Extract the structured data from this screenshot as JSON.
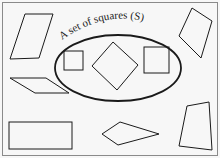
{
  "diagram": {
    "type": "set-diagram",
    "set_label": "A set of squares (S)",
    "colors": {
      "background": "#f7f7f7",
      "stroke": "#1a1a1a",
      "frame": "#8a8a8a"
    },
    "inside_set": [
      {
        "shape": "square",
        "name": "small-square"
      },
      {
        "shape": "square-rotated",
        "name": "diamond-square"
      },
      {
        "shape": "square",
        "name": "right-square"
      }
    ],
    "outside_set": [
      {
        "shape": "parallelogram",
        "name": "top-left-parallelogram"
      },
      {
        "shape": "quadrilateral",
        "name": "top-right-quadrilateral"
      },
      {
        "shape": "parallelogram",
        "name": "left-flat-parallelogram"
      },
      {
        "shape": "rectangle",
        "name": "bottom-left-rectangle"
      },
      {
        "shape": "kite",
        "name": "bottom-kite"
      },
      {
        "shape": "trapezoid",
        "name": "bottom-right-trapezoid"
      }
    ]
  }
}
